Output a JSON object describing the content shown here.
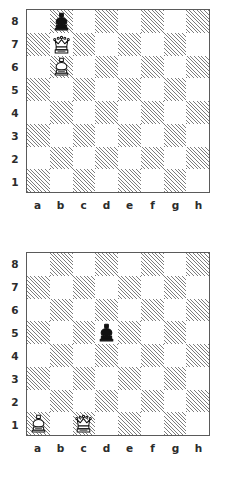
{
  "document": {
    "kind": "chess-diagram-pair",
    "background_color": "#ffffff",
    "board_border_color": "#5a5a5a",
    "dark_square_hatch_color": "#7d7d7d",
    "light_square_color": "#ffffff",
    "label_color": "#2b2b2b"
  },
  "files": [
    "a",
    "b",
    "c",
    "d",
    "e",
    "f",
    "g",
    "h"
  ],
  "ranks": [
    "8",
    "7",
    "6",
    "5",
    "4",
    "3",
    "2",
    "1"
  ],
  "boards": [
    {
      "id": "board-1",
      "position_label": "",
      "pieces": [
        {
          "square": "b8",
          "file": "b",
          "rank": "8",
          "piece": "king",
          "color": "black",
          "glyph": "♚",
          "name": "black-king"
        },
        {
          "square": "b7",
          "file": "b",
          "rank": "7",
          "piece": "queen",
          "color": "white",
          "glyph": "♕",
          "name": "white-queen"
        },
        {
          "square": "b6",
          "file": "b",
          "rank": "6",
          "piece": "king",
          "color": "white",
          "glyph": "♔",
          "name": "white-king"
        }
      ],
      "fen": "1k6/1Q6/1K6/8/8/8/8/8"
    },
    {
      "id": "board-2",
      "position_label": "",
      "pieces": [
        {
          "square": "d5",
          "file": "d",
          "rank": "5",
          "piece": "king",
          "color": "black",
          "glyph": "♚",
          "name": "black-king"
        },
        {
          "square": "a1",
          "file": "a",
          "rank": "1",
          "piece": "king",
          "color": "white",
          "glyph": "♔",
          "name": "white-king"
        },
        {
          "square": "c1",
          "file": "c",
          "rank": "1",
          "piece": "queen",
          "color": "white",
          "glyph": "♕",
          "name": "white-queen"
        }
      ],
      "fen": "8/8/8/3k4/8/8/8/K1Q5"
    }
  ]
}
